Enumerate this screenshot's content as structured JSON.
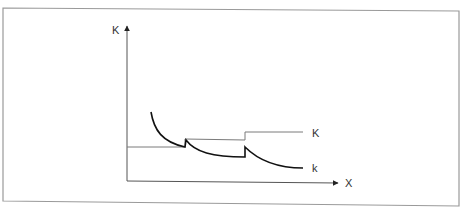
{
  "diagram": {
    "title": "",
    "axes": {
      "y_label": "K",
      "x_label": "X"
    },
    "curves": [
      {
        "name": "K",
        "label": "K",
        "description": "step function, rises at two points",
        "color": "#7a7a7a"
      },
      {
        "name": "k",
        "label": "k",
        "description": "decaying curve with two upward jumps",
        "color": "#111111"
      }
    ],
    "colors": {
      "frame": "#9a9a9a",
      "axes": "#444444",
      "step_line": "#7a7a7a",
      "decay_curve": "#111111",
      "background": "#ffffff"
    }
  }
}
